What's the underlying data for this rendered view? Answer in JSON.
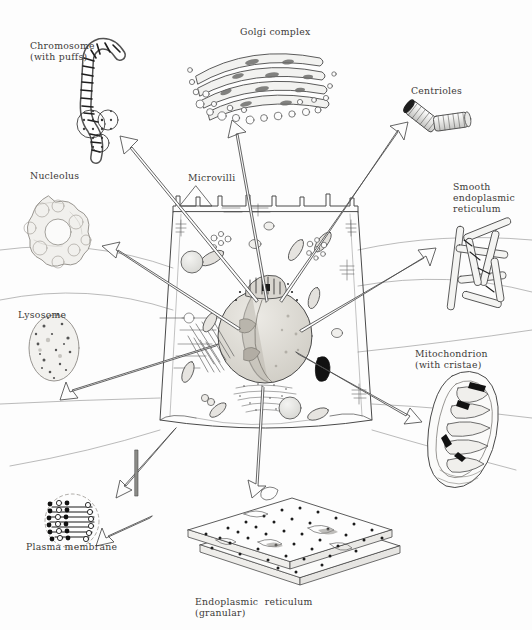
{
  "figure": {
    "background_color": "#fdfdfd",
    "ink_color": "#4a4a4a",
    "label_color": "#3c3a38"
  },
  "labels": [
    {
      "id": "chromosome",
      "text": "Chromosome\n(with puffs)",
      "x": 30,
      "y": 40,
      "align": "left"
    },
    {
      "id": "golgi",
      "text": "Golgi complex",
      "x": 240,
      "y": 26,
      "align": "left"
    },
    {
      "id": "centrioles",
      "text": "Centrioles",
      "x": 411,
      "y": 85,
      "align": "left"
    },
    {
      "id": "nucleolus",
      "text": "Nucleolus",
      "x": 30,
      "y": 170,
      "align": "left"
    },
    {
      "id": "microvilli",
      "text": "Microvilli",
      "x": 188,
      "y": 172,
      "align": "left"
    },
    {
      "id": "smooth-er",
      "text": "Smooth\nendoplasmic\nreticulum",
      "x": 453,
      "y": 181,
      "align": "left"
    },
    {
      "id": "lysosome",
      "text": "Lysosome",
      "x": 18,
      "y": 309,
      "align": "left"
    },
    {
      "id": "mitochondrion",
      "text": "Mitochondrion\n(with cristae)",
      "x": 415,
      "y": 348,
      "align": "left"
    },
    {
      "id": "plasma-membrane",
      "text": "Plasma membrane",
      "x": 26,
      "y": 541,
      "align": "left"
    },
    {
      "id": "rough-er",
      "text": "Endoplasmic  reticulum\n(granular)",
      "x": 195,
      "y": 596,
      "align": "left"
    }
  ],
  "organelles": [
    {
      "id": "chromosome",
      "name": "chromosome-with-puffs",
      "label_ref": "chromosome"
    },
    {
      "id": "golgi",
      "name": "golgi-complex",
      "label_ref": "golgi"
    },
    {
      "id": "centrioles",
      "name": "centriole-pair",
      "label_ref": "centrioles"
    },
    {
      "id": "nucleolus",
      "name": "nucleolus",
      "label_ref": "nucleolus"
    },
    {
      "id": "smooth-er",
      "name": "smooth-endoplasmic-reticulum",
      "label_ref": "smooth-er"
    },
    {
      "id": "lysosome",
      "name": "lysosome",
      "label_ref": "lysosome"
    },
    {
      "id": "mitochondrion",
      "name": "mitochondrion",
      "label_ref": "mitochondrion"
    },
    {
      "id": "plasma-membrane",
      "name": "plasma-membrane-bilayer",
      "label_ref": "plasma-membrane"
    },
    {
      "id": "rough-er",
      "name": "granular-endoplasmic-reticulum",
      "label_ref": "rough-er"
    },
    {
      "id": "cell-body",
      "name": "cell-body",
      "label_ref": null
    },
    {
      "id": "microvilli",
      "name": "microvilli",
      "label_ref": "microvilli"
    }
  ]
}
